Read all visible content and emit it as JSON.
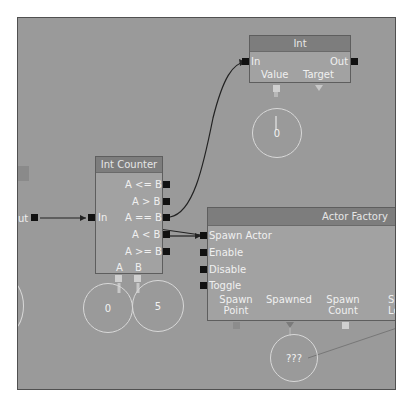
{
  "canvas": {
    "background": "#9a9a9a"
  },
  "nodes": {
    "int_node": {
      "title": "Int",
      "inputs": [
        "In"
      ],
      "outputs": [
        "Out"
      ],
      "vars": [
        "Value",
        "Target"
      ]
    },
    "int_counter": {
      "title": "Int Counter",
      "inputs": [
        "In"
      ],
      "outputs": [
        "A <= B",
        "A > B",
        "A == B",
        "A < B",
        "A >= B"
      ],
      "vars": [
        "A",
        "B"
      ]
    },
    "actor_factory": {
      "title": "Actor Factory",
      "inputs": [
        "Spawn Actor",
        "Enable",
        "Disable",
        "Toggle"
      ],
      "vars": [
        "Spawn\nPoint",
        "Spawned",
        "Spawn\nCount",
        "Sp\nLoc"
      ]
    },
    "left_partial": {
      "output": "ut"
    }
  },
  "variables": {
    "int_value": "0",
    "counter_a": "0",
    "counter_b": "5",
    "spawned": "???"
  }
}
